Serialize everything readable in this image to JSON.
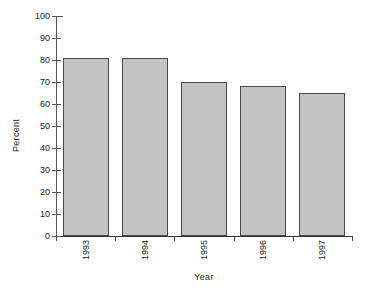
{
  "chart_data": {
    "type": "bar",
    "title": "",
    "subtitle": "",
    "xlabel": "Year",
    "ylabel": "Percent",
    "categories": [
      "1993",
      "1994",
      "1995",
      "1996",
      "1997"
    ],
    "values": [
      81,
      81,
      70,
      68,
      65
    ],
    "series": [
      {
        "name": "Percent",
        "values": [
          81,
          81,
          70,
          68,
          65
        ]
      }
    ],
    "ylim": [
      0,
      100
    ],
    "ytick_interval": 10,
    "yticks": [
      0,
      10,
      20,
      30,
      40,
      50,
      60,
      70,
      80,
      90,
      100
    ],
    "ytick_labels": [
      "0",
      "10",
      "20",
      "30",
      "40",
      "50",
      "60",
      "70",
      "80",
      "90",
      "100"
    ],
    "grid": false,
    "legend": false,
    "legend_position": "none",
    "bar_fill_color": "#c3c3c3",
    "bar_border_color": "#4a4a4a",
    "axis_color": "#444444",
    "background_color": "#ffffff",
    "xtick_label_rotation": 90,
    "ylabel_rotation": 90
  }
}
